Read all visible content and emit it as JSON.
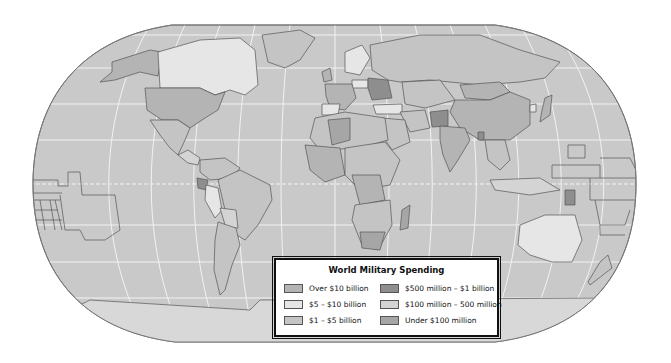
{
  "map": {
    "title": "World Military Spending",
    "projection": "Robinson-like world map",
    "colors": {
      "ocean": "#c9c9c9",
      "land_default": "#bdbdbd",
      "grid": "#f2f2f2",
      "border": "#555555"
    }
  },
  "legend": {
    "title": "World Military Spending",
    "items": [
      {
        "label": "Over $10 billion",
        "color": "#b4b4b4"
      },
      {
        "label": "$5 – $10 billion",
        "color": "#e6e6e6"
      },
      {
        "label": "$1 – $5 billion",
        "color": "#c4c4c4"
      },
      {
        "label": "$500 million – $1 billion",
        "color": "#8e8e8e"
      },
      {
        "label": "$100 million – 500 million",
        "color": "#d4d4d4"
      },
      {
        "label": "Under $100 million",
        "color": "#a6a6a6"
      }
    ]
  }
}
